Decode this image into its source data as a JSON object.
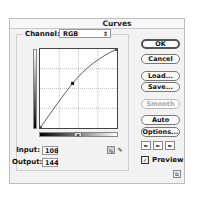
{
  "window": {
    "title": "Curves"
  },
  "channel": {
    "label": "Channel:",
    "value": "RGB",
    "arrow_icon": "⇕"
  },
  "curve": {
    "control_point": {
      "input": 108,
      "output": 144
    },
    "grid_divisions": 4
  },
  "fields": {
    "input_label": "Input:",
    "input_value": "108",
    "output_label": "Output:",
    "output_value": "144"
  },
  "tools": {
    "curve_tool": "∿",
    "pencil_tool": "✎"
  },
  "buttons": {
    "ok": "OK",
    "cancel": "Cancel",
    "load": "Load...",
    "save": "Save...",
    "smooth": "Smooth",
    "auto": "Auto",
    "options": "Options..."
  },
  "eyedroppers": {
    "black": "✒",
    "gray": "✒",
    "white": "✒"
  },
  "preview": {
    "label": "Preview",
    "checked": true,
    "check_glyph": "✓"
  },
  "resize_icon": "⧉"
}
